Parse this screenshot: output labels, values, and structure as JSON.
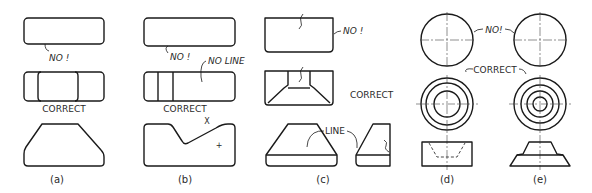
{
  "figure": {
    "panels": [
      {
        "id": "a",
        "caption": "(a)",
        "labels": {
          "top": "NO !",
          "middle": "CORRECT"
        }
      },
      {
        "id": "b",
        "caption": "(b)",
        "labels": {
          "top": "NO !",
          "no_line": "NO LINE",
          "middle": "CORRECT",
          "marker": "X",
          "center_mark": "+"
        }
      },
      {
        "id": "c",
        "caption": "(c)",
        "labels": {
          "top": "NO !",
          "middle": "CORRECT",
          "line": "LINE"
        }
      },
      {
        "id": "d",
        "caption": "(d)"
      },
      {
        "id": "e",
        "caption": "(e)"
      }
    ],
    "shared_labels": {
      "de_top": "NO!",
      "de_middle": "CORRECT"
    }
  },
  "colors": {
    "line": "#1a1a1a",
    "text": "#2a2a2a",
    "background": "#ffffff"
  }
}
